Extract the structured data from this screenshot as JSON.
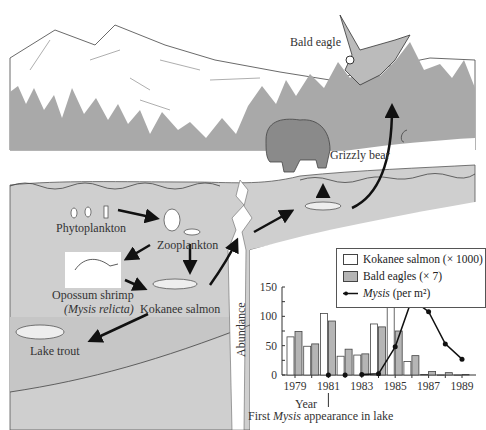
{
  "diagram": {
    "labels": {
      "bald_eagle": "Bald eagle",
      "grizzly_bear": "Grizzly bear",
      "phytoplankton": "Phytoplankton",
      "zooplankton": "Zooplankton",
      "opossum_shrimp": "Opossum shrimp",
      "mysis_relicta": "(Mysis relicta)",
      "kokanee_salmon": "Kokanee salmon",
      "lake_trout": "Lake trout"
    },
    "colors": {
      "forest": "#a9a9a9",
      "lake": "#cfcfcf",
      "deep_lake": "#c4c4c4",
      "bear": "#8a8a8a",
      "arrow": "#111111"
    }
  },
  "chart_data": {
    "type": "bar",
    "categories": [
      "1979",
      "1980",
      "1981",
      "1982",
      "1983",
      "1984",
      "1985",
      "1986",
      "1987",
      "1988",
      "1989"
    ],
    "series": [
      {
        "name": "Kokanee salmon (× 1000)",
        "kind": "bar",
        "color": "#ffffff",
        "values": [
          65,
          49,
          105,
          32,
          34,
          87,
          118,
          23,
          1,
          0,
          0
        ]
      },
      {
        "name": "Bald eagles (× 7)",
        "kind": "bar",
        "color": "#b5b5b5",
        "values": [
          74,
          53,
          92,
          44,
          36,
          82,
          75,
          33,
          6,
          4,
          1
        ]
      },
      {
        "name": "Mysis (per m²)",
        "kind": "line",
        "color": "#111111",
        "values": [
          null,
          null,
          0,
          0,
          1,
          2,
          48,
          129,
          108,
          53,
          27
        ]
      }
    ],
    "title": "",
    "xlabel": "Year",
    "ylabel": "Abundance",
    "ylim": [
      0,
      150
    ],
    "yticks": [
      0,
      50,
      100,
      150
    ],
    "xticks": [
      "1979",
      "1981",
      "1983",
      "1985",
      "1987",
      "1989"
    ],
    "legend_position": "top-right",
    "annotation": {
      "text_before": "First ",
      "text_italic": "Mysis",
      "text_after": " appearance in lake",
      "year": "1981"
    }
  },
  "legend": {
    "kokanee": "Kokanee salmon (× 1000)",
    "eagles": "Bald eagles (× 7)",
    "mysis_italic": "Mysis",
    "mysis_rest": " (per m²)"
  }
}
